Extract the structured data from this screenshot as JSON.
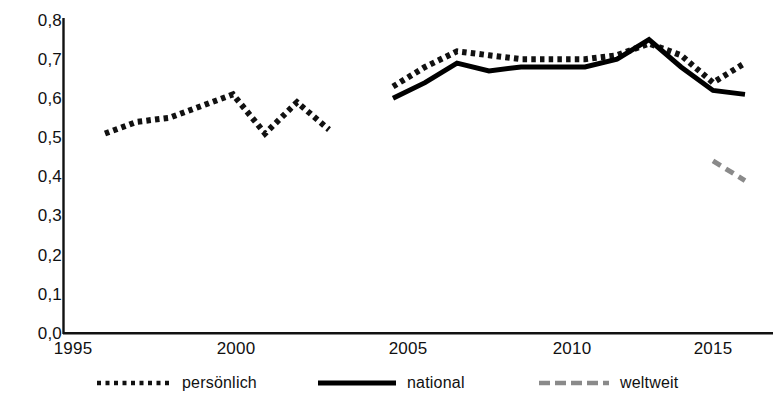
{
  "chart_data": {
    "type": "line",
    "title": "",
    "xlabel": "",
    "ylabel": "",
    "xlim": [
      1995,
      2017
    ],
    "ylim": [
      0.0,
      0.8
    ],
    "grid": false,
    "legend_position": "bottom",
    "x_tick_labels": [
      "1995",
      "2000",
      "2005",
      "2010",
      "2015"
    ],
    "x_tick_values": [
      1995,
      2000,
      2005,
      2010,
      2015
    ],
    "y_tick_labels": [
      "0,8",
      "0,7",
      "0,6",
      "0,5",
      "0,4",
      "0,3",
      "0,2",
      "0,1",
      "0,0"
    ],
    "y_tick_values": [
      0.8,
      0.7,
      0.6,
      0.5,
      0.4,
      0.3,
      0.2,
      0.1,
      0.0
    ],
    "decimal_separator": ",",
    "series": [
      {
        "name": "persönlich",
        "style": "dotted",
        "color": "#111111",
        "segments": [
          {
            "x": [
              1996,
              1997,
              1998,
              1999,
              2000,
              2001,
              2002,
              2003
            ],
            "values": [
              0.51,
              0.54,
              0.55,
              0.58,
              0.61,
              0.51,
              0.59,
              0.52
            ]
          },
          {
            "x": [
              2005,
              2006,
              2007,
              2008,
              2009,
              2010,
              2011,
              2012,
              2013,
              2014,
              2015,
              2016
            ],
            "values": [
              0.63,
              0.68,
              0.72,
              0.71,
              0.7,
              0.7,
              0.7,
              0.71,
              0.74,
              0.71,
              0.64,
              0.69
            ]
          }
        ]
      },
      {
        "name": "national",
        "style": "solid",
        "color": "#000000",
        "segments": [
          {
            "x": [
              2005,
              2006,
              2007,
              2008,
              2009,
              2010,
              2011,
              2012,
              2013,
              2014,
              2015,
              2016
            ],
            "values": [
              0.6,
              0.64,
              0.69,
              0.67,
              0.68,
              0.68,
              0.68,
              0.7,
              0.75,
              0.68,
              0.62,
              0.61
            ]
          }
        ]
      },
      {
        "name": "weltweit",
        "style": "dashed",
        "color": "#8a8a8a",
        "segments": [
          {
            "x": [
              2015,
              2016
            ],
            "values": [
              0.44,
              0.39
            ]
          }
        ]
      }
    ]
  },
  "legend": {
    "items": [
      {
        "label": "persönlich",
        "style": "dotted",
        "color": "#111111"
      },
      {
        "label": "national",
        "style": "solid",
        "color": "#000000"
      },
      {
        "label": "weltweit",
        "style": "dashed",
        "color": "#8a8a8a"
      }
    ]
  }
}
